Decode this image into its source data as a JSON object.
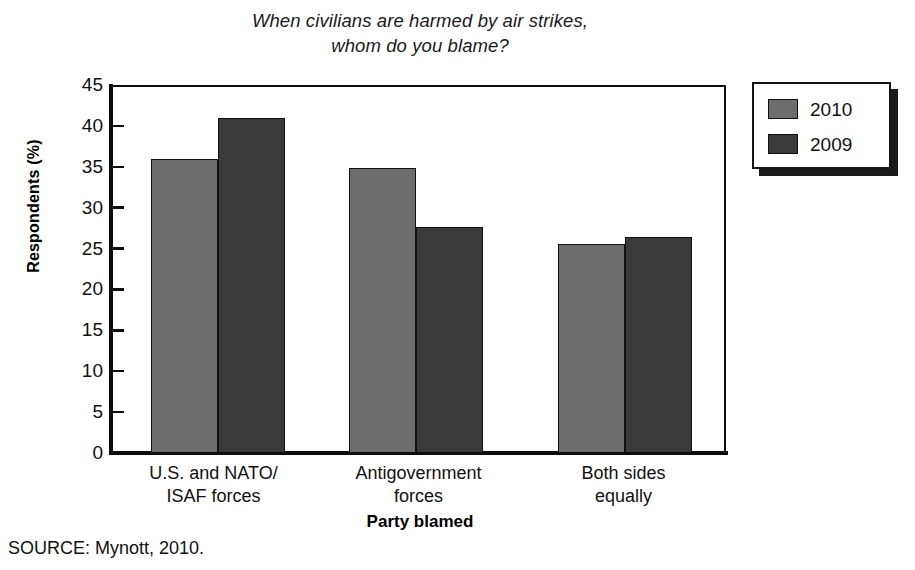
{
  "chart_data": {
    "type": "bar",
    "title": "When civilians are harmed by air strikes, whom do you blame?",
    "title_lines": [
      "When civilians are harmed by air strikes,",
      "whom do you blame?"
    ],
    "xlabel": "Party blamed",
    "ylabel": "Respondents (%)",
    "ylim": [
      0,
      45
    ],
    "ytick_step": 5,
    "ytick_labels": [
      "45",
      "40",
      "35",
      "30",
      "25",
      "20",
      "15",
      "10",
      "5",
      "0"
    ],
    "ytick_values": [
      45,
      40,
      35,
      30,
      25,
      20,
      15,
      10,
      5,
      0
    ],
    "grid": false,
    "legend_position": "right-outside",
    "categories": [
      "U.S. and NATO/ISAF forces",
      "Antigovernment forces",
      "Both sides equally"
    ],
    "category_lines": [
      [
        "U.S. and NATO/",
        "ISAF forces"
      ],
      [
        "Antigovernment",
        "forces"
      ],
      [
        "Both sides",
        "equally"
      ]
    ],
    "series": [
      {
        "name": "2010",
        "color": "#6d6d6d",
        "values": [
          36.0,
          34.8,
          25.6
        ]
      },
      {
        "name": "2009",
        "color": "#3a3a3a",
        "values": [
          41.0,
          27.6,
          26.4
        ]
      }
    ],
    "source": "SOURCE: Mynott, 2010."
  },
  "legend": {
    "items": [
      {
        "label": "2010",
        "color": "#6d6d6d"
      },
      {
        "label": "2009",
        "color": "#3a3a3a"
      }
    ]
  }
}
